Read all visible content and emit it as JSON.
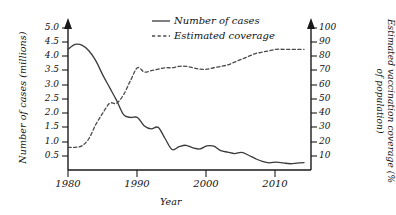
{
  "chart_data": {
    "type": "line",
    "title": "",
    "xlabel": "Year",
    "ylabel": "Number of cases (millions)",
    "y2label": "Estimated vaccination coverage (% of population)",
    "xlim": [
      1980,
      2015
    ],
    "ylim": [
      0,
      5.0
    ],
    "y2lim": [
      0,
      100
    ],
    "grid": false,
    "legend_position": "top-center",
    "x_ticks": [
      "1980",
      "1990",
      "2000",
      "2010"
    ],
    "x_tick_values": [
      1980,
      1990,
      2000,
      2010
    ],
    "y_ticks": [
      "0.5",
      "1.0",
      "1.5",
      "2.0",
      "2.5",
      "3.0",
      "3.5",
      "4.0",
      "4.5",
      "5.0"
    ],
    "y_tick_values": [
      0.5,
      1.0,
      1.5,
      2.0,
      2.5,
      3.0,
      3.5,
      4.0,
      4.5,
      5.0
    ],
    "y2_ticks": [
      "10",
      "20",
      "30",
      "40",
      "50",
      "60",
      "70",
      "80",
      "90",
      "100"
    ],
    "y2_tick_values": [
      10,
      20,
      30,
      40,
      50,
      60,
      70,
      80,
      90,
      100
    ],
    "x": [
      1980,
      1981,
      1982,
      1983,
      1984,
      1985,
      1986,
      1987,
      1988,
      1989,
      1990,
      1991,
      1992,
      1993,
      1994,
      1995,
      1996,
      1997,
      1998,
      1999,
      2000,
      2001,
      2002,
      2003,
      2004,
      2005,
      2006,
      2007,
      2008,
      2009,
      2010,
      2011,
      2012,
      2013,
      2014
    ],
    "series": [
      {
        "name": "Number of cases",
        "axis": "left",
        "style": "solid",
        "color": "#3a3a3a",
        "units": "millions",
        "values": [
          4.25,
          4.42,
          4.4,
          4.2,
          3.85,
          3.35,
          2.9,
          2.45,
          1.95,
          1.85,
          1.85,
          1.55,
          1.45,
          1.5,
          1.1,
          0.72,
          0.82,
          0.87,
          0.78,
          0.74,
          0.85,
          0.84,
          0.68,
          0.63,
          0.58,
          0.62,
          0.52,
          0.4,
          0.3,
          0.25,
          0.28,
          0.25,
          0.22,
          0.24,
          0.26
        ]
      },
      {
        "name": "Estimated coverage",
        "axis": "right",
        "style": "dashed",
        "color": "#4a4a4a",
        "units": "%",
        "values": [
          16,
          16,
          17,
          22,
          32,
          40,
          47,
          47,
          53,
          63,
          72,
          69,
          70,
          71,
          72,
          72,
          73,
          73,
          72,
          71,
          71,
          72,
          73,
          74,
          76,
          78,
          80,
          82,
          83,
          84,
          85,
          85,
          85,
          85,
          85
        ]
      }
    ],
    "legend": [
      {
        "label": "Number of cases",
        "style": "solid"
      },
      {
        "label": "Estimated coverage",
        "style": "dashed"
      }
    ]
  },
  "axes": {
    "x_title": "Year",
    "y_left_title": "Number of cases (millions)",
    "y_right_title": "Estimated vaccination coverage (% of population)"
  },
  "legend": {
    "cases_label": "Number of cases",
    "coverage_label": "Estimated coverage"
  },
  "ticks": {
    "left": [
      "5.0",
      "4.5",
      "4.0",
      "3.5",
      "3.0",
      "2.5",
      "2.0",
      "1.5",
      "1.0",
      "0.5"
    ],
    "right": [
      "100",
      "90",
      "80",
      "70",
      "60",
      "50",
      "40",
      "30",
      "20",
      "10"
    ],
    "x": [
      "1980",
      "1990",
      "2000",
      "2010"
    ]
  },
  "colors": {
    "cases_line": "#3a3a3a",
    "coverage_line": "#4a4a4a",
    "axis": "#1a1a1a",
    "text": "#111111",
    "background": "#ffffff"
  }
}
